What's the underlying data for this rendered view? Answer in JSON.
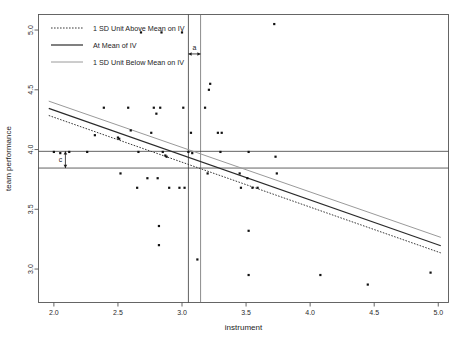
{
  "chart_data": {
    "type": "scatter",
    "title": "",
    "xlabel": "instrument",
    "ylabel": "team performance",
    "xlim": [
      1.88,
      5.08
    ],
    "ylim": [
      2.72,
      5.13
    ],
    "xticks": [
      "2.0",
      "2.5",
      "3.0",
      "3.5",
      "4.0",
      "4.5",
      "5.0"
    ],
    "xtick_values": [
      2.0,
      2.5,
      3.0,
      3.5,
      4.0,
      4.5,
      5.0
    ],
    "yticks": [
      "5.0",
      "4.5",
      "4.0",
      "3.5",
      "3.0"
    ],
    "ytick_values": [
      5.0,
      4.5,
      4.0,
      3.5,
      3.0
    ],
    "grid": false,
    "legend_position": "top-left",
    "points": [
      [
        2.0,
        3.98
      ],
      [
        2.05,
        3.97
      ],
      [
        2.12,
        3.98
      ],
      [
        2.26,
        3.98
      ],
      [
        2.32,
        4.12
      ],
      [
        2.39,
        4.35
      ],
      [
        2.5,
        4.1
      ],
      [
        2.51,
        4.09
      ],
      [
        2.52,
        3.8
      ],
      [
        2.58,
        4.35
      ],
      [
        2.6,
        4.16
      ],
      [
        2.65,
        3.68
      ],
      [
        2.66,
        3.98
      ],
      [
        2.73,
        3.76
      ],
      [
        2.76,
        4.14
      ],
      [
        2.78,
        4.35
      ],
      [
        2.8,
        4.3
      ],
      [
        2.81,
        3.76
      ],
      [
        2.82,
        3.36
      ],
      [
        2.82,
        3.2
      ],
      [
        2.83,
        4.35
      ],
      [
        2.85,
        3.98
      ],
      [
        2.87,
        3.95
      ],
      [
        2.88,
        3.94
      ],
      [
        2.9,
        3.68
      ],
      [
        2.98,
        3.68
      ],
      [
        3.0,
        4.98
      ],
      [
        3.01,
        4.35
      ],
      [
        3.02,
        3.68
      ],
      [
        2.84,
        4.98
      ],
      [
        2.68,
        4.98
      ],
      [
        3.05,
        3.98
      ],
      [
        3.07,
        4.14
      ],
      [
        3.08,
        3.97
      ],
      [
        3.12,
        3.08
      ],
      [
        3.18,
        4.35
      ],
      [
        3.2,
        3.8
      ],
      [
        3.21,
        4.5
      ],
      [
        3.22,
        4.55
      ],
      [
        3.28,
        4.14
      ],
      [
        3.31,
        4.14
      ],
      [
        3.3,
        3.98
      ],
      [
        3.45,
        3.8
      ],
      [
        3.46,
        3.68
      ],
      [
        3.51,
        3.76
      ],
      [
        3.52,
        3.98
      ],
      [
        3.52,
        3.32
      ],
      [
        3.52,
        2.95
      ],
      [
        3.55,
        3.68
      ],
      [
        3.59,
        3.68
      ],
      [
        3.72,
        5.05
      ],
      [
        3.73,
        3.94
      ],
      [
        3.74,
        3.8
      ],
      [
        4.08,
        2.95
      ],
      [
        4.45,
        2.87
      ],
      [
        4.94,
        2.97
      ]
    ],
    "regression_lines": [
      {
        "name": "1 SD Unit Above Mean on IV",
        "style": "dotted",
        "color": "#3a3a3a",
        "x": [
          1.96,
          5.02
        ],
        "y": [
          4.285,
          3.135
        ]
      },
      {
        "name": "At Mean of IV",
        "style": "solid",
        "color": "#2a2a2a",
        "x": [
          1.96,
          5.02
        ],
        "y": [
          4.345,
          3.195
        ]
      },
      {
        "name": "1 SD Unit Below Mean on IV",
        "style": "solid-light",
        "color": "#9a9a9a",
        "x": [
          1.96,
          5.02
        ],
        "y": [
          4.405,
          3.265
        ]
      }
    ],
    "reference_lines": {
      "vertical": [
        {
          "x": 3.05,
          "color": "#3a3a3a"
        },
        {
          "x": 3.145,
          "color": "#6e6e6e"
        }
      ],
      "horizontal": [
        {
          "y": 3.985,
          "color": "#3a3a3a"
        },
        {
          "y": 3.845,
          "color": "#3a3a3a"
        }
      ]
    },
    "annotations": [
      {
        "label": "a",
        "type": "horizontal-span",
        "from_x": 3.05,
        "to_x": 3.145,
        "at_y": 4.8
      },
      {
        "label": "c",
        "type": "vertical-span",
        "at_x": 2.09,
        "from_y": 3.985,
        "to_y": 3.845
      }
    ]
  },
  "legend": {
    "entries": [
      {
        "label": "1 SD Unit Above Mean on IV"
      },
      {
        "label": "At Mean of IV"
      },
      {
        "label": "1 SD Unit Below Mean on IV"
      }
    ]
  }
}
